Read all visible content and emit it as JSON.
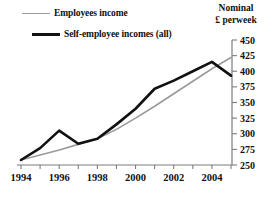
{
  "legend": {
    "items": [
      {
        "label": "Employees income",
        "color": "#9a9a9a",
        "style": "thin"
      },
      {
        "label": "Self-employee incomes (all)",
        "color": "#111111",
        "style": "thick"
      }
    ]
  },
  "axis_title": {
    "line1": "Nominal",
    "line2": "£ perweek"
  },
  "chart_data": {
    "type": "line",
    "title": "",
    "subtitle": "",
    "xlabel": "",
    "ylabel": "Nominal £ perweek",
    "x": [
      1994,
      1995,
      1996,
      1997,
      1998,
      1999,
      2000,
      2001,
      2002,
      2003,
      2004,
      2005
    ],
    "xlim": [
      1994,
      2005
    ],
    "ylim": [
      250,
      450
    ],
    "xticks": [
      1994,
      1995,
      1996,
      1997,
      1998,
      1999,
      2000,
      2001,
      2002,
      2003,
      2004,
      2005
    ],
    "xtick_labels": [
      "1994",
      "",
      "1996",
      "",
      "1998",
      "",
      "2000",
      "",
      "2002",
      "",
      "2004",
      ""
    ],
    "yticks": [
      250,
      275,
      300,
      325,
      350,
      375,
      400,
      425,
      450
    ],
    "ytick_labels": [
      "250",
      "275",
      "300",
      "325",
      "350",
      "375",
      "400",
      "425",
      "450"
    ],
    "grid": false,
    "legend_position": "top-left",
    "y_axis_side": "right",
    "series": [
      {
        "name": "Employees income",
        "color": "#9a9a9a",
        "values": [
          258,
          266,
          274,
          283,
          292,
          307,
          325,
          344,
          364,
          384,
          404,
          422
        ]
      },
      {
        "name": "Self-employee incomes (all)",
        "color": "#111111",
        "values": [
          258,
          277,
          305,
          284,
          292,
          315,
          340,
          372,
          385,
          400,
          415,
          393
        ]
      }
    ]
  }
}
